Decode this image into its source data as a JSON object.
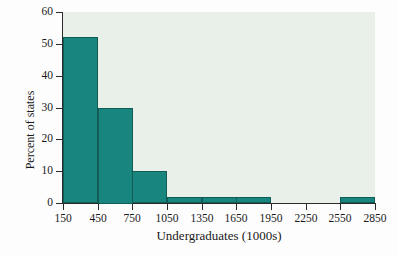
{
  "chart_data": {
    "type": "bar",
    "title": "",
    "xlabel": "Undergraduates (1000s)",
    "ylabel": "Percent of states",
    "categories": [
      "150-450",
      "450-750",
      "750-1050",
      "1050-1350",
      "1350-1650",
      "1650-1950",
      "1950-2250",
      "2250-2550",
      "2550-2850"
    ],
    "bin_edges": [
      150,
      450,
      750,
      1050,
      1350,
      1650,
      1950,
      2250,
      2550,
      2850
    ],
    "values": [
      52,
      30,
      10,
      2,
      2,
      2,
      0,
      0,
      2
    ],
    "x_tick_labels": [
      "150",
      "450",
      "750",
      "1050",
      "1350",
      "1650",
      "1950",
      "2250",
      "2550",
      "2850"
    ],
    "y_tick_labels": [
      "0",
      "10",
      "20",
      "30",
      "40",
      "50",
      "60"
    ],
    "y_tick_values": [
      0,
      10,
      20,
      30,
      40,
      50,
      60
    ],
    "xlim": [
      150,
      2850
    ],
    "ylim": [
      0,
      60
    ],
    "grid": false,
    "legend": false,
    "bar_color": "#18857f",
    "bar_edge_color": "#105d58",
    "panel_color": "#e9f0e9",
    "axis_color": "#2b2b2b",
    "page_background": "#fdfdfd"
  }
}
